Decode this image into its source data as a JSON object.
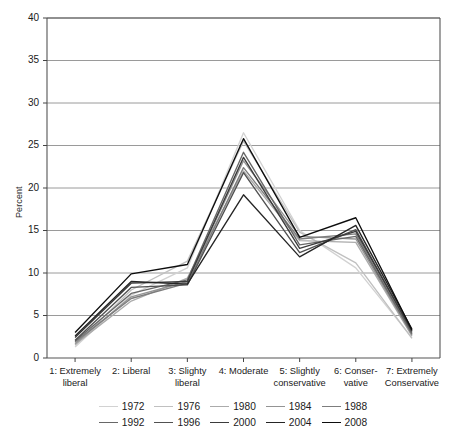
{
  "chart_data": {
    "type": "line",
    "title": "",
    "xlabel": "",
    "ylabel": "Percent",
    "ylim": [
      0,
      40
    ],
    "ytick_step": 5,
    "yticks": [
      0,
      5,
      10,
      15,
      20,
      25,
      30,
      35,
      40
    ],
    "grid": true,
    "grid_axis": "y",
    "legend_position": "bottom",
    "categories": [
      "1: Extremely liberal",
      "2: Liberal",
      "3: Slighty liberal",
      "4: Moderate",
      "5: Slightly conservative",
      "6: Conservative",
      "7: Extremely Conservative"
    ],
    "category_lines": [
      [
        "1: Extremely",
        "liberal"
      ],
      [
        "2: Liberal",
        ""
      ],
      [
        "3: Slighty",
        "liberal"
      ],
      [
        "4: Moderate",
        ""
      ],
      [
        "5: Slightly",
        "conservative"
      ],
      [
        "6: Conser-",
        "vative"
      ],
      [
        "7: Extremely",
        "Conservative"
      ]
    ],
    "series": [
      {
        "name": "1972",
        "color": "#d2d2d2",
        "values": [
          1.3,
          7.4,
          10.6,
          26.5,
          15.0,
          10.6,
          2.4
        ]
      },
      {
        "name": "1976",
        "color": "#c0c0c0",
        "values": [
          1.5,
          8.0,
          11.4,
          25.5,
          14.8,
          11.2,
          2.3
        ]
      },
      {
        "name": "1980",
        "color": "#ababab",
        "values": [
          1.6,
          6.7,
          9.4,
          22.0,
          13.8,
          13.6,
          2.6
        ]
      },
      {
        "name": "1984",
        "color": "#949494",
        "values": [
          1.7,
          7.2,
          9.0,
          23.2,
          14.3,
          14.0,
          2.7
        ]
      },
      {
        "name": "1988",
        "color": "#7d7d7d",
        "values": [
          1.9,
          7.0,
          8.8,
          22.4,
          14.0,
          14.6,
          2.8
        ]
      },
      {
        "name": "1992",
        "color": "#676767",
        "values": [
          2.0,
          7.6,
          9.2,
          24.2,
          13.3,
          14.3,
          2.9
        ]
      },
      {
        "name": "1996",
        "color": "#515151",
        "values": [
          2.1,
          8.3,
          8.6,
          21.8,
          12.4,
          15.1,
          3.1
        ]
      },
      {
        "name": "2000",
        "color": "#3b3b3b",
        "values": [
          2.4,
          8.8,
          9.0,
          23.6,
          12.9,
          14.9,
          3.2
        ]
      },
      {
        "name": "2004",
        "color": "#252525",
        "values": [
          2.6,
          9.0,
          8.7,
          19.2,
          11.9,
          15.6,
          3.4
        ]
      },
      {
        "name": "2008",
        "color": "#0d0d0d",
        "values": [
          3.0,
          9.9,
          11.0,
          25.8,
          14.2,
          16.5,
          3.3
        ]
      }
    ]
  },
  "legend": {
    "row1": [
      "1972",
      "1976",
      "1980",
      "1984",
      "1988"
    ],
    "row2": [
      "1992",
      "1996",
      "2000",
      "2004",
      "2008"
    ]
  },
  "axis": {
    "y_title": "Percent"
  }
}
